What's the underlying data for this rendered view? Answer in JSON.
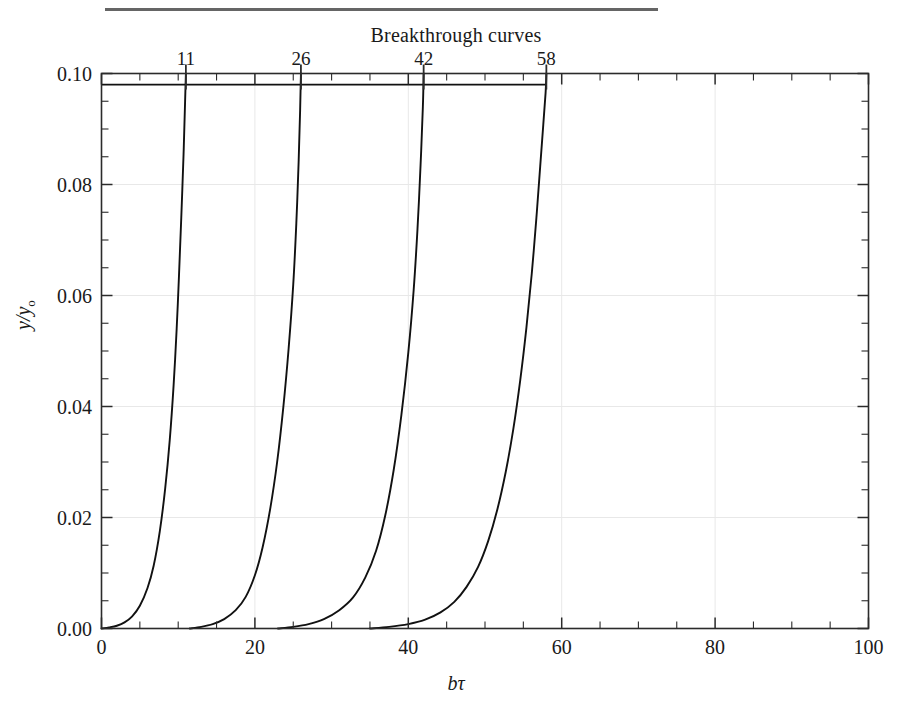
{
  "page": {
    "rule_visible": true
  },
  "chart_data": {
    "type": "line",
    "title": "Breakthrough curves",
    "subtitle": "",
    "xlabel": "bτ",
    "ylabel": "y/yₒ",
    "ylabel_main": "y/y",
    "ylabel_sub": "o",
    "xlim": [
      0,
      100
    ],
    "ylim": [
      0.0,
      0.1
    ],
    "grid": true,
    "grid_color": "#e8e8e8",
    "line_color": "#111111",
    "legend": "none",
    "axis_color": "#2b2b2b",
    "background": "#ffffff",
    "xticks": [
      0,
      20,
      40,
      60,
      80,
      100
    ],
    "xtick_labels": [
      "0",
      "20",
      "40",
      "60",
      "80",
      "100"
    ],
    "xminor_step": 5,
    "yticks": [
      0.0,
      0.02,
      0.04,
      0.06,
      0.08,
      0.1
    ],
    "ytick_labels": [
      "0.00",
      "0.02",
      "0.04",
      "0.06",
      "0.08",
      "0.10"
    ],
    "yminor_step": 0.005,
    "top_axis": {
      "ticks": [
        11,
        26,
        42,
        58
      ],
      "tick_labels": [
        "11",
        "26",
        "42",
        "58"
      ],
      "minor_step": 5
    },
    "plateau": {
      "y": 0.098,
      "x_start": 0,
      "x_end": 58
    },
    "series": [
      {
        "name": "curve-11",
        "breakthrough": 11,
        "x": [
          0.0,
          1.0,
          2.0,
          3.0,
          4.0,
          5.0,
          6.0,
          6.8,
          7.6,
          8.3,
          8.9,
          9.4,
          9.8,
          10.1,
          10.4,
          10.7,
          10.9,
          11.0
        ],
        "y": [
          0.0,
          0.0002,
          0.0005,
          0.0011,
          0.0022,
          0.0041,
          0.0073,
          0.0113,
          0.0175,
          0.0252,
          0.034,
          0.0438,
          0.054,
          0.0635,
          0.074,
          0.0855,
          0.095,
          0.0998
        ]
      },
      {
        "name": "curve-26",
        "breakthrough": 26,
        "x": [
          11.5,
          13.0,
          14.5,
          16.0,
          17.5,
          18.8,
          20.0,
          21.0,
          22.0,
          22.9,
          23.7,
          24.4,
          25.0,
          25.4,
          25.7,
          25.9,
          26.0
        ],
        "y": [
          0.0,
          0.0003,
          0.0008,
          0.0017,
          0.0033,
          0.0057,
          0.0096,
          0.0146,
          0.0216,
          0.03,
          0.0398,
          0.0505,
          0.062,
          0.073,
          0.084,
          0.0935,
          0.0998
        ]
      },
      {
        "name": "curve-42",
        "breakthrough": 42,
        "x": [
          23.0,
          25.0,
          27.0,
          29.0,
          31.0,
          32.8,
          34.4,
          35.8,
          37.0,
          38.1,
          39.1,
          40.0,
          40.7,
          41.2,
          41.6,
          41.9,
          42.0
        ],
        "y": [
          0.0,
          0.0003,
          0.0008,
          0.0017,
          0.0033,
          0.0056,
          0.0092,
          0.014,
          0.0204,
          0.0286,
          0.0385,
          0.0497,
          0.061,
          0.072,
          0.0835,
          0.094,
          0.0998
        ]
      },
      {
        "name": "curve-58",
        "breakthrough": 58,
        "x": [
          35.0,
          37.5,
          40.0,
          42.2,
          44.2,
          46.0,
          47.6,
          49.1,
          50.4,
          51.6,
          52.7,
          53.7,
          54.6,
          55.4,
          56.1,
          56.7,
          57.2,
          57.6,
          57.9,
          58.0
        ],
        "y": [
          0.0,
          0.0003,
          0.0008,
          0.0016,
          0.0029,
          0.0048,
          0.0075,
          0.0111,
          0.0157,
          0.0214,
          0.0282,
          0.036,
          0.0448,
          0.0542,
          0.064,
          0.074,
          0.0833,
          0.0908,
          0.0965,
          0.0998
        ]
      }
    ]
  }
}
